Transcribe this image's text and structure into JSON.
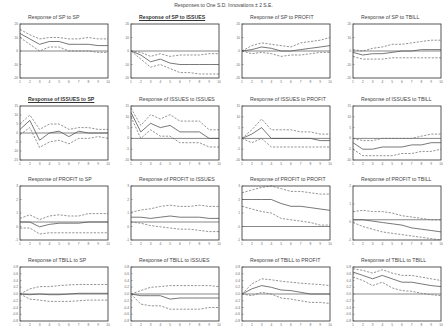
{
  "title": "Responses to One S.D. Innovations ± 2 S.E.",
  "chart_data": {
    "type": "line",
    "title": "Responses to One S.D. Innovations ± 2 S.E.",
    "grid": false,
    "x": [
      1,
      2,
      3,
      4,
      5,
      6,
      7,
      8,
      9,
      10
    ],
    "xlabel": "",
    "ylabel": "",
    "panels": [
      {
        "title": "Response of SP to SP",
        "underline": false,
        "ylim": [
          -20,
          20
        ],
        "yticks": [
          "20",
          "10",
          "0",
          "-10",
          "-20"
        ],
        "response": [
          13,
          9,
          5,
          7,
          7,
          5,
          5,
          5,
          4,
          4
        ],
        "upper": [
          16,
          12,
          9,
          10,
          10,
          9,
          9,
          10,
          9,
          9
        ],
        "lower": [
          10,
          5,
          0,
          3,
          3,
          0,
          0,
          0,
          -1,
          -1
        ]
      },
      {
        "title": "Response of SP to ISSUES",
        "underline": true,
        "ylim": [
          -20,
          20
        ],
        "yticks": [
          "20",
          "10",
          "0",
          "-10",
          "-20"
        ],
        "response": [
          0,
          -3,
          -8,
          -6,
          -9,
          -10,
          -10,
          -10,
          -10,
          -10
        ],
        "upper": [
          0,
          -1,
          -4,
          -2,
          -4,
          -3,
          -3,
          -3,
          -2,
          -2
        ],
        "lower": [
          0,
          -6,
          -12,
          -10,
          -13,
          -16,
          -16,
          -17,
          -17,
          -17
        ]
      },
      {
        "title": "Response of SP to PROFIT",
        "underline": false,
        "ylim": [
          -20,
          20
        ],
        "yticks": [
          "20",
          "10",
          "0",
          "-10",
          "-20"
        ],
        "response": [
          0,
          1,
          3,
          2,
          0,
          0,
          1,
          2,
          3,
          4
        ],
        "upper": [
          0,
          4,
          6,
          5,
          4,
          3,
          6,
          7,
          8,
          10
        ],
        "lower": [
          0,
          -2,
          -1,
          -2,
          -4,
          -3,
          -3,
          -2,
          -1,
          -1
        ]
      },
      {
        "title": "Response of SP to TBILL",
        "underline": false,
        "ylim": [
          -20,
          20
        ],
        "yticks": [
          "20",
          "10",
          "0",
          "-10",
          "-20"
        ],
        "response": [
          -1,
          -3,
          -2,
          -2,
          -1,
          0,
          0,
          1,
          1,
          1
        ],
        "upper": [
          1,
          0,
          2,
          3,
          5,
          5,
          6,
          7,
          8,
          8
        ],
        "lower": [
          -4,
          -6,
          -6,
          -6,
          -5,
          -5,
          -5,
          -5,
          -5,
          -5
        ]
      },
      {
        "title": "Response of ISSUES to SP",
        "underline": true,
        "ylim": [
          -15,
          15
        ],
        "yticks": [
          "15",
          "10",
          "5",
          "0",
          "-5",
          "-10",
          "-15"
        ],
        "response": [
          2,
          7,
          -4,
          0,
          1,
          -2,
          1,
          0,
          0,
          0
        ],
        "upper": [
          5,
          10,
          2,
          5,
          5,
          2,
          3,
          3,
          2,
          2
        ],
        "lower": [
          -1,
          3,
          -8,
          -5,
          -4,
          -6,
          -3,
          -3,
          -2,
          -3
        ]
      },
      {
        "title": "Response of ISSUES to ISSUES",
        "underline": false,
        "ylim": [
          -10,
          15
        ],
        "yticks": [
          "15",
          "10",
          "5",
          "0",
          "-5",
          "-10"
        ],
        "response": [
          12,
          3,
          7,
          5,
          6,
          3,
          3,
          3,
          0,
          0
        ],
        "upper": [
          14,
          6,
          11,
          9,
          11,
          8,
          8,
          8,
          4,
          4
        ],
        "lower": [
          10,
          0,
          4,
          1,
          1,
          -2,
          -2,
          -2,
          -4,
          -4
        ]
      },
      {
        "title": "Response of ISSUES to PROFIT",
        "underline": false,
        "ylim": [
          -10,
          15
        ],
        "yticks": [
          "15",
          "10",
          "5",
          "0",
          "-5",
          "-10"
        ],
        "response": [
          0,
          2,
          5,
          0,
          0,
          0,
          0,
          0,
          -1,
          -1
        ],
        "upper": [
          0,
          4,
          9,
          4,
          4,
          4,
          3,
          3,
          2,
          2
        ],
        "lower": [
          0,
          -2,
          0,
          -4,
          -4,
          -4,
          -4,
          -4,
          -4,
          -4
        ]
      },
      {
        "title": "Response of ISSUES to TBILL",
        "underline": false,
        "ylim": [
          -10,
          15
        ],
        "yticks": [
          "15",
          "10",
          "5",
          "0",
          "-5",
          "-10"
        ],
        "response": [
          -2,
          -5,
          -5,
          -4,
          -4,
          -4,
          -3,
          -3,
          -2,
          -2
        ],
        "upper": [
          0,
          -1,
          -1,
          0,
          0,
          0,
          0,
          1,
          2,
          2
        ],
        "lower": [
          -5,
          -8,
          -8,
          -8,
          -8,
          -7,
          -7,
          -6,
          -6,
          -5
        ]
      },
      {
        "title": "Response of PROFIT to SP",
        "underline": false,
        "ylim": [
          -1.5,
          3
        ],
        "yticks": [
          "3",
          "2",
          "1",
          "0",
          "-1"
        ],
        "response": [
          0,
          0,
          -0.4,
          -0.2,
          -0.1,
          -0.1,
          -0.1,
          0,
          0,
          0
        ],
        "upper": [
          0.3,
          0.6,
          0.2,
          0.5,
          0.6,
          0.5,
          0.5,
          0.7,
          0.7,
          0.7
        ],
        "lower": [
          -0.5,
          -0.5,
          -1,
          -0.9,
          -0.9,
          -0.9,
          -0.9,
          -0.9,
          -0.9,
          -0.9
        ]
      },
      {
        "title": "Response of PROFIT to ISSUES",
        "underline": false,
        "ylim": [
          -1.5,
          3
        ],
        "yticks": [
          "3",
          "2",
          "1",
          "0",
          "-1"
        ],
        "response": [
          0.4,
          0.4,
          0.3,
          0.4,
          0.5,
          0.4,
          0.4,
          0.4,
          0.3,
          0.3
        ],
        "upper": [
          0.8,
          1,
          1.1,
          1.3,
          1.4,
          1.3,
          1.3,
          1.4,
          1.3,
          1.3
        ],
        "lower": [
          0,
          -0.1,
          -0.3,
          -0.4,
          -0.5,
          -0.6,
          -0.6,
          -0.7,
          -0.8,
          -0.8
        ]
      },
      {
        "title": "Response of PROFIT to PROFIT",
        "underline": false,
        "ylim": [
          -1,
          3
        ],
        "yticks": [
          "3",
          "2",
          "1",
          "0",
          "-1"
        ],
        "response": [
          2,
          2,
          2,
          2,
          1.7,
          1.5,
          1.5,
          1.4,
          1.3,
          1.2
        ],
        "upper": [
          2.5,
          2.7,
          2.9,
          3,
          2.8,
          2.6,
          2.6,
          2.5,
          2.4,
          2.4
        ],
        "lower": [
          1.5,
          1.3,
          1.1,
          1,
          0.6,
          0.5,
          0.4,
          0.3,
          0.1,
          0.1
        ]
      },
      {
        "title": "Response of PROFIT to TBILL",
        "underline": false,
        "ylim": [
          -1.5,
          2.5
        ],
        "yticks": [
          "2",
          "1",
          "0",
          "-1"
        ],
        "response": [
          0,
          0,
          -0.1,
          -0.2,
          -0.3,
          -0.4,
          -0.6,
          -0.7,
          -0.8,
          -0.9
        ],
        "upper": [
          0.6,
          0.7,
          0.6,
          0.6,
          0.5,
          0.3,
          0.2,
          0.1,
          0,
          0
        ],
        "lower": [
          -0.2,
          -0.5,
          -0.7,
          -0.9,
          -1,
          -1.1,
          -1.2,
          -1.3,
          -1.4,
          -1.5
        ]
      },
      {
        "title": "Response of TBILL to SP",
        "underline": false,
        "ylim": [
          -0.8,
          0.8
        ],
        "yticks": [
          "0.8",
          "0.6",
          "0.4",
          "0.2",
          "0.0",
          "-0.2",
          "-0.4",
          "-0.6",
          "-0.8"
        ],
        "response": [
          0,
          -0.02,
          0,
          -0.02,
          -0.02,
          0,
          0.02,
          0.02,
          0.02,
          0.02
        ],
        "upper": [
          0,
          0.15,
          0.22,
          0.22,
          0.25,
          0.27,
          0.28,
          0.28,
          0.28,
          0.28
        ],
        "lower": [
          0,
          -0.15,
          -0.18,
          -0.22,
          -0.22,
          -0.22,
          -0.2,
          -0.18,
          -0.18,
          -0.18
        ]
      },
      {
        "title": "Response of TBILL to ISSUES",
        "underline": false,
        "ylim": [
          -0.8,
          0.8
        ],
        "yticks": [
          "0.8",
          "0.6",
          "0.4",
          "0.2",
          "0.0",
          "-0.2",
          "-0.4",
          "-0.6",
          "-0.8"
        ],
        "response": [
          0,
          -0.05,
          -0.05,
          -0.05,
          -0.15,
          -0.12,
          -0.12,
          -0.12,
          -0.12,
          -0.12
        ],
        "upper": [
          0,
          0.1,
          0.2,
          0.22,
          0.25,
          0.25,
          0.25,
          0.25,
          0.25,
          0.22
        ],
        "lower": [
          0,
          -0.3,
          -0.35,
          -0.35,
          -0.45,
          -0.45,
          -0.45,
          -0.45,
          -0.4,
          -0.4
        ]
      },
      {
        "title": "Response of TBILL to PROFIT",
        "underline": false,
        "ylim": [
          -0.8,
          0.8
        ],
        "yticks": [
          "0.8",
          "0.6",
          "0.4",
          "0.2",
          "0.0",
          "-0.2",
          "-0.4",
          "-0.6",
          "-0.8"
        ],
        "response": [
          0,
          0.15,
          0.25,
          0.2,
          0.12,
          0.1,
          0.05,
          0,
          0,
          0
        ],
        "upper": [
          0,
          0.3,
          0.45,
          0.42,
          0.38,
          0.35,
          0.32,
          0.3,
          0.28,
          0.25
        ],
        "lower": [
          0,
          -0.05,
          0.05,
          0,
          -0.12,
          -0.15,
          -0.2,
          -0.25,
          -0.25,
          -0.28
        ]
      },
      {
        "title": "Response of TBILL to TBILL",
        "underline": false,
        "ylim": [
          -0.8,
          0.8
        ],
        "yticks": [
          "0.8",
          "0.6",
          "0.4",
          "0.2",
          "0.0",
          "-0.2",
          "-0.4",
          "-0.6",
          "-0.8"
        ],
        "response": [
          0.65,
          0.55,
          0.45,
          0.55,
          0.45,
          0.35,
          0.35,
          0.3,
          0.25,
          0.22
        ],
        "upper": [
          0.75,
          0.7,
          0.62,
          0.72,
          0.62,
          0.55,
          0.55,
          0.5,
          0.45,
          0.4
        ],
        "lower": [
          0.5,
          0.4,
          0.25,
          0.35,
          0.18,
          0.1,
          0.08,
          0.02,
          -0.02,
          -0.05
        ]
      }
    ]
  }
}
